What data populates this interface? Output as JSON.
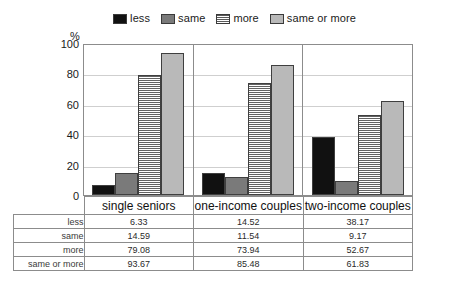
{
  "legend": {
    "items": [
      {
        "label": "less",
        "swatch": "black-solid",
        "color": "#111111"
      },
      {
        "label": "same",
        "swatch": "gray-solid",
        "color": "#7a7a7a"
      },
      {
        "label": "more",
        "swatch": "white-horizontal-hatch",
        "color": "#ffffff"
      },
      {
        "label": "same or more",
        "swatch": "light-gray-solid",
        "color": "#b9b9b9"
      }
    ]
  },
  "axis": {
    "unit_label": "%",
    "ticks": [
      "100",
      "80",
      "60",
      "40",
      "20",
      "0"
    ]
  },
  "table": {
    "row_labels": [
      "less",
      "same",
      "more",
      "same or more"
    ],
    "column_headers": [
      "single seniors",
      "one-income couples",
      "two-income couples"
    ],
    "rows": [
      {
        "label": "less",
        "values": [
          "6.33",
          "14.52",
          "38.17"
        ]
      },
      {
        "label": "same",
        "values": [
          "14.59",
          "11.54",
          "9.17"
        ]
      },
      {
        "label": "more",
        "values": [
          "79.08",
          "73.94",
          "52.67"
        ]
      },
      {
        "label": "same or more",
        "values": [
          "93.67",
          "85.48",
          "61.83"
        ]
      }
    ]
  },
  "chart_data": {
    "type": "bar",
    "title": "",
    "xlabel": "",
    "ylabel": "%",
    "ylim": [
      0,
      100
    ],
    "yticks": [
      0,
      20,
      40,
      60,
      80,
      100
    ],
    "grid": true,
    "legend_position": "top-center",
    "categories": [
      "single seniors",
      "one-income couples",
      "two-income couples"
    ],
    "series": [
      {
        "name": "less",
        "values": [
          6.33,
          14.52,
          38.17
        ],
        "color": "#111111",
        "pattern": "solid"
      },
      {
        "name": "same",
        "values": [
          14.59,
          11.54,
          9.17
        ],
        "color": "#7a7a7a",
        "pattern": "solid"
      },
      {
        "name": "more",
        "values": [
          79.08,
          73.94,
          52.67
        ],
        "color": "#ffffff",
        "pattern": "horizontal-lines"
      },
      {
        "name": "same or more",
        "values": [
          93.67,
          85.48,
          61.83
        ],
        "color": "#b9b9b9",
        "pattern": "solid"
      }
    ]
  }
}
